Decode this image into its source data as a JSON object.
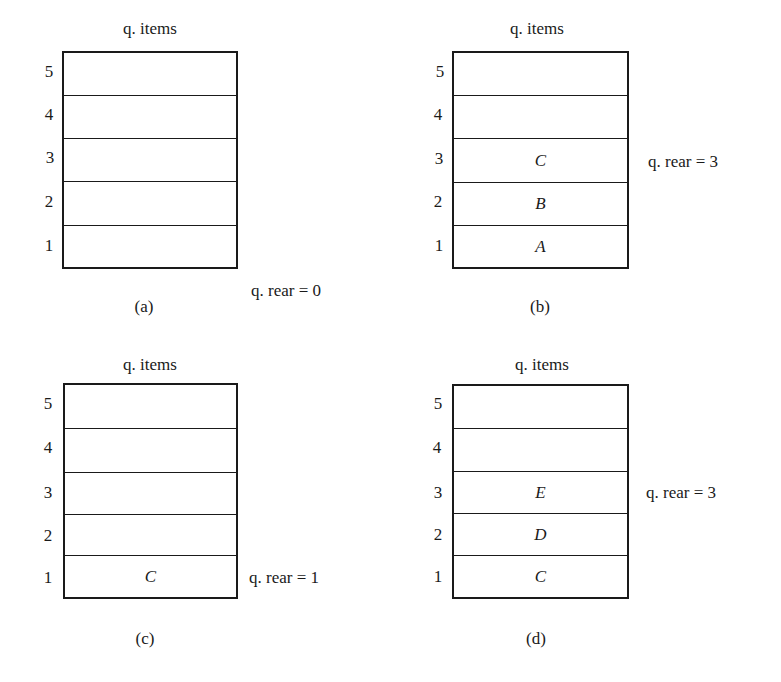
{
  "diagram": {
    "panels": [
      {
        "id": "a",
        "title": "q. items",
        "caption": "(a)",
        "rear_label": "q. rear = 0",
        "rear_value": 0,
        "slots": [
          {
            "index": "5",
            "value": ""
          },
          {
            "index": "4",
            "value": ""
          },
          {
            "index": "3",
            "value": ""
          },
          {
            "index": "2",
            "value": ""
          },
          {
            "index": "1",
            "value": ""
          }
        ]
      },
      {
        "id": "b",
        "title": "q. items",
        "caption": "(b)",
        "rear_label": "q. rear = 3",
        "rear_value": 3,
        "slots": [
          {
            "index": "5",
            "value": ""
          },
          {
            "index": "4",
            "value": ""
          },
          {
            "index": "3",
            "value": "C"
          },
          {
            "index": "2",
            "value": "B"
          },
          {
            "index": "1",
            "value": "A"
          }
        ]
      },
      {
        "id": "c",
        "title": "q. items",
        "caption": "(c)",
        "rear_label": "q. rear = 1",
        "rear_value": 1,
        "slots": [
          {
            "index": "5",
            "value": ""
          },
          {
            "index": "4",
            "value": ""
          },
          {
            "index": "3",
            "value": ""
          },
          {
            "index": "2",
            "value": ""
          },
          {
            "index": "1",
            "value": "C"
          }
        ]
      },
      {
        "id": "d",
        "title": "q. items",
        "caption": "(d)",
        "rear_label": "q. rear = 3",
        "rear_value": 3,
        "slots": [
          {
            "index": "5",
            "value": ""
          },
          {
            "index": "4",
            "value": ""
          },
          {
            "index": "3",
            "value": "E"
          },
          {
            "index": "2",
            "value": "D"
          },
          {
            "index": "1",
            "value": "C"
          }
        ]
      }
    ]
  }
}
